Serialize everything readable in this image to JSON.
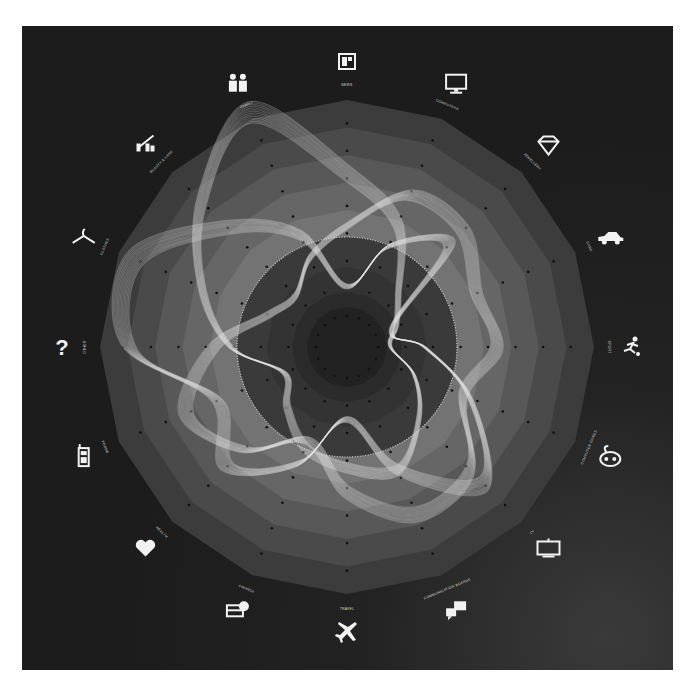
{
  "chart_data": {
    "type": "radar",
    "title": "",
    "center": [
      347,
      347
    ],
    "axes_count": 16,
    "categories": [
      {
        "label": "NEWS",
        "icon": "newspaper-icon"
      },
      {
        "label": "COMPUTERS",
        "icon": "monitor-icon"
      },
      {
        "label": "JEWELLERY",
        "icon": "diamond-icon"
      },
      {
        "label": "CARS",
        "icon": "car-icon"
      },
      {
        "label": "SPORT",
        "icon": "runner-icon"
      },
      {
        "label": "COMPUTER GAMES",
        "icon": "gamepad-icon"
      },
      {
        "label": "TV",
        "icon": "tv-icon"
      },
      {
        "label": "COMMUNICATION BOARDS",
        "icon": "chat-bubbles-icon"
      },
      {
        "label": "TRAVEL",
        "icon": "airplane-icon"
      },
      {
        "label": "FINANCE",
        "icon": "credit-card-icon"
      },
      {
        "label": "HEALTH",
        "icon": "heart-icon"
      },
      {
        "label": "PHONE",
        "icon": "mobile-phone-icon"
      },
      {
        "label": "OTHER",
        "icon": "question-mark-icon"
      },
      {
        "label": "CLOTHES",
        "icon": "hanger-icon"
      },
      {
        "label": "BEAUTY & CARE",
        "icon": "beauty-care-icon"
      },
      {
        "label": "FAMILY",
        "icon": "family-icon"
      }
    ],
    "rings": {
      "outer_radius": 247,
      "ring_step": 27.5,
      "ring_count": 9,
      "ring_colors": [
        "#3c3c3c",
        "#4a4a4a",
        "#585858",
        "#666666",
        "#737373",
        "#7e7e7e",
        "#4a4a4a",
        "#3c3c3c",
        "#2e2e2e"
      ],
      "inner_circle_radius": 110,
      "inner_dark_radius": 40
    },
    "series": [
      {
        "name": "ribbon-1",
        "values": [
          0.72,
          0.55,
          0.3,
          0.22,
          0.18,
          0.3,
          0.42,
          0.55,
          0.5,
          0.45,
          0.35,
          0.28,
          0.48,
          0.65,
          0.85,
          1.05
        ]
      },
      {
        "name": "ribbon-2",
        "values": [
          0.5,
          0.68,
          0.68,
          0.58,
          0.62,
          0.52,
          0.72,
          0.75,
          0.6,
          0.42,
          0.6,
          0.72,
          0.55,
          0.35,
          0.3,
          0.4
        ]
      },
      {
        "name": "ribbon-3",
        "values": [
          0.25,
          0.45,
          0.6,
          0.2,
          0.32,
          0.55,
          0.8,
          0.55,
          0.3,
          0.52,
          0.7,
          0.58,
          0.9,
          0.95,
          0.7,
          0.5
        ]
      }
    ],
    "grid": true,
    "legend": "none"
  }
}
